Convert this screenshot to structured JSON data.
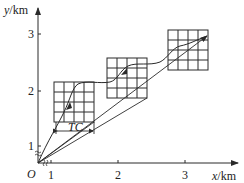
{
  "diagram": {
    "type": "coordinate-path-diagram",
    "axes": {
      "x_label_var": "x",
      "x_label_unit": "/km",
      "y_label_var": "y",
      "y_label_unit": "/km",
      "origin_label": "O",
      "x_ticks": [
        "1",
        "2",
        "3"
      ],
      "y_ticks": [
        "1",
        "2",
        "3"
      ],
      "axis_break_mark": "≈"
    },
    "grids": [
      {
        "name": "grid-box-1",
        "rows": 4,
        "cols": 4
      },
      {
        "name": "grid-box-2",
        "rows": 4,
        "cols": 4
      },
      {
        "name": "grid-box-3",
        "rows": 4,
        "cols": 4
      }
    ],
    "dimension_label": "TC",
    "colors": {
      "line": "#2a2a2a",
      "background": "#ffffff"
    }
  }
}
